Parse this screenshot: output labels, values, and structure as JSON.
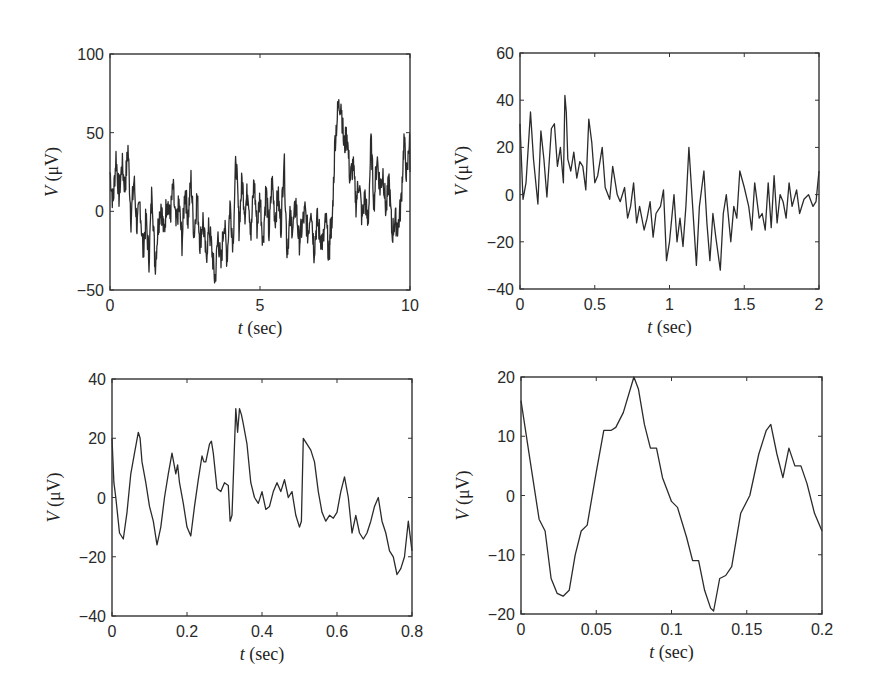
{
  "figure": {
    "width": 873,
    "height": 699,
    "line_color": "#2b2b2b",
    "frame_color": "#333333"
  },
  "chart_data": [
    {
      "type": "line",
      "panel": "top-left",
      "title": "",
      "xlabel_var": "t",
      "xlabel_unit": " (sec)",
      "ylabel_var": "V",
      "ylabel_unit": " (μV)",
      "xlim": [
        0,
        10
      ],
      "ylim": [
        -50,
        100
      ],
      "xticks": [
        0,
        5,
        10
      ],
      "yticks": [
        -50,
        0,
        50,
        100
      ],
      "xtick_labels": [
        "0",
        "5",
        "10"
      ],
      "ytick_labels": [
        "−50",
        "0",
        "50",
        "100"
      ],
      "box": {
        "left": 110,
        "top": 54,
        "right": 410,
        "bottom": 290
      },
      "grid": false,
      "x": [
        0,
        0.1,
        0.2,
        0.3,
        0.4,
        0.5,
        0.6,
        0.7,
        0.8,
        0.9,
        1.0,
        1.1,
        1.2,
        1.3,
        1.4,
        1.5,
        1.6,
        1.7,
        1.8,
        1.9,
        2.0,
        2.1,
        2.2,
        2.3,
        2.4,
        2.5,
        2.6,
        2.7,
        2.8,
        2.9,
        3.0,
        3.1,
        3.2,
        3.3,
        3.4,
        3.5,
        3.6,
        3.7,
        3.8,
        3.9,
        4.0,
        4.1,
        4.2,
        4.3,
        4.4,
        4.5,
        4.6,
        4.7,
        4.8,
        4.9,
        5.0,
        5.1,
        5.2,
        5.3,
        5.4,
        5.5,
        5.6,
        5.7,
        5.8,
        5.9,
        6.0,
        6.1,
        6.2,
        6.3,
        6.4,
        6.5,
        6.6,
        6.7,
        6.8,
        6.9,
        7.0,
        7.1,
        7.2,
        7.3,
        7.35,
        7.4,
        7.5,
        7.6,
        7.7,
        7.8,
        7.9,
        8.0,
        8.1,
        8.2,
        8.3,
        8.4,
        8.5,
        8.6,
        8.7,
        8.8,
        8.9,
        9.0,
        9.1,
        9.2,
        9.3,
        9.4,
        9.5,
        9.6,
        9.7,
        9.8,
        9.9,
        10.0
      ],
      "values": [
        25,
        5,
        35,
        10,
        30,
        15,
        40,
        -5,
        20,
        -10,
        5,
        -25,
        -5,
        -30,
        15,
        -35,
        -10,
        5,
        -15,
        10,
        -5,
        15,
        -10,
        5,
        -20,
        15,
        -5,
        20,
        -15,
        10,
        -20,
        -5,
        -30,
        -10,
        -25,
        -45,
        -15,
        -35,
        -5,
        -30,
        5,
        -20,
        35,
        -10,
        20,
        0,
        15,
        -15,
        20,
        -10,
        10,
        -20,
        15,
        -15,
        20,
        -5,
        10,
        -10,
        35,
        -25,
        -5,
        -10,
        5,
        -20,
        -10,
        0,
        -15,
        5,
        -25,
        -5,
        -15,
        -20,
        -5,
        -30,
        -10,
        -10,
        45,
        65,
        70,
        40,
        50,
        20,
        30,
        5,
        20,
        -5,
        10,
        -10,
        45,
        5,
        35,
        15,
        25,
        0,
        20,
        -15,
        -5,
        -10,
        5,
        45,
        20,
        55,
        25
      ],
      "note": "dense noisy EEG-like trace; values approximate envelope"
    },
    {
      "type": "line",
      "panel": "top-right",
      "title": "",
      "xlabel_var": "t",
      "xlabel_unit": " (sec)",
      "ylabel_var": "V",
      "ylabel_unit": " (μV)",
      "xlim": [
        0,
        2
      ],
      "ylim": [
        -40,
        60
      ],
      "xticks": [
        0,
        0.5,
        1,
        1.5,
        2
      ],
      "yticks": [
        -40,
        -20,
        0,
        20,
        40,
        60
      ],
      "xtick_labels": [
        "0",
        "0.5",
        "1",
        "1.5",
        "2"
      ],
      "ytick_labels": [
        "−40",
        "−20",
        "0",
        "20",
        "40",
        "60"
      ],
      "box": {
        "left": 520,
        "top": 53,
        "right": 819,
        "bottom": 289
      },
      "grid": false,
      "x": [
        0,
        0.02,
        0.04,
        0.07,
        0.09,
        0.12,
        0.14,
        0.16,
        0.18,
        0.21,
        0.23,
        0.25,
        0.27,
        0.29,
        0.3,
        0.31,
        0.32,
        0.34,
        0.36,
        0.38,
        0.4,
        0.42,
        0.44,
        0.46,
        0.48,
        0.5,
        0.52,
        0.55,
        0.57,
        0.6,
        0.62,
        0.65,
        0.67,
        0.7,
        0.72,
        0.74,
        0.76,
        0.78,
        0.8,
        0.83,
        0.85,
        0.87,
        0.89,
        0.91,
        0.94,
        0.96,
        0.98,
        1.0,
        1.03,
        1.05,
        1.07,
        1.09,
        1.11,
        1.13,
        1.15,
        1.18,
        1.2,
        1.23,
        1.25,
        1.27,
        1.29,
        1.31,
        1.34,
        1.36,
        1.38,
        1.41,
        1.43,
        1.45,
        1.47,
        1.5,
        1.53,
        1.55,
        1.57,
        1.6,
        1.62,
        1.64,
        1.66,
        1.68,
        1.7,
        1.72,
        1.74,
        1.76,
        1.78,
        1.8,
        1.82,
        1.85,
        1.87,
        1.9,
        1.93,
        1.96,
        1.98,
        2.0
      ],
      "values": [
        30,
        -2,
        5,
        35,
        15,
        -4,
        27,
        15,
        -1,
        28,
        30,
        12,
        20,
        5,
        42,
        35,
        15,
        10,
        18,
        7,
        14,
        12,
        2,
        32,
        22,
        5,
        8,
        20,
        3,
        -2,
        12,
        0,
        -3,
        3,
        -10,
        -5,
        5,
        -12,
        -5,
        -15,
        -10,
        -3,
        -18,
        -8,
        -5,
        2,
        -28,
        -20,
        0,
        -20,
        -10,
        -22,
        -5,
        20,
        0,
        -30,
        -5,
        10,
        -12,
        -28,
        -8,
        -18,
        -32,
        -8,
        0,
        -20,
        -5,
        -10,
        10,
        3,
        -5,
        -15,
        5,
        -10,
        -8,
        -15,
        5,
        -14,
        8,
        -12,
        0,
        -3,
        -10,
        5,
        -5,
        2,
        -8,
        -2,
        0,
        -5,
        -3,
        10
      ]
    },
    {
      "type": "line",
      "panel": "bottom-left",
      "title": "",
      "xlabel_var": "t",
      "xlabel_unit": " (sec)",
      "ylabel_var": "V",
      "ylabel_unit": " (μV)",
      "xlim": [
        0,
        0.8
      ],
      "ylim": [
        -40,
        40
      ],
      "xticks": [
        0,
        0.2,
        0.4,
        0.6,
        0.8
      ],
      "yticks": [
        -40,
        -20,
        0,
        20,
        40
      ],
      "xtick_labels": [
        "0",
        "0.2",
        "0.4",
        "0.6",
        "0.8"
      ],
      "ytick_labels": [
        "−40",
        "0",
        "20",
        "40",
        "−20"
      ],
      "ytick_labels_ordered": [
        "−40",
        "−20",
        "0",
        "20",
        "40"
      ],
      "box": {
        "left": 112,
        "top": 379,
        "right": 412,
        "bottom": 616
      },
      "grid": false,
      "x": [
        0,
        0.005,
        0.01,
        0.02,
        0.03,
        0.04,
        0.05,
        0.06,
        0.07,
        0.075,
        0.08,
        0.09,
        0.1,
        0.11,
        0.12,
        0.13,
        0.14,
        0.15,
        0.16,
        0.17,
        0.175,
        0.18,
        0.19,
        0.2,
        0.21,
        0.22,
        0.23,
        0.24,
        0.245,
        0.25,
        0.26,
        0.265,
        0.27,
        0.28,
        0.29,
        0.3,
        0.31,
        0.315,
        0.32,
        0.33,
        0.335,
        0.34,
        0.345,
        0.35,
        0.36,
        0.37,
        0.38,
        0.39,
        0.4,
        0.41,
        0.42,
        0.43,
        0.44,
        0.45,
        0.46,
        0.47,
        0.48,
        0.49,
        0.5,
        0.505,
        0.51,
        0.52,
        0.53,
        0.54,
        0.55,
        0.56,
        0.57,
        0.58,
        0.59,
        0.6,
        0.61,
        0.62,
        0.63,
        0.64,
        0.65,
        0.66,
        0.67,
        0.68,
        0.69,
        0.7,
        0.71,
        0.72,
        0.73,
        0.74,
        0.75,
        0.76,
        0.77,
        0.78,
        0.79,
        0.8
      ],
      "values": [
        20,
        5,
        0,
        -12,
        -14,
        -5,
        8,
        15,
        22,
        20,
        12,
        5,
        -3,
        -8,
        -16,
        -10,
        0,
        8,
        15,
        8,
        11,
        5,
        -2,
        -10,
        -13,
        -3,
        6,
        14,
        12,
        12,
        18,
        19,
        15,
        3,
        2,
        5,
        4,
        -8,
        -6,
        30,
        22,
        30,
        28,
        25,
        18,
        5,
        0,
        -2,
        2,
        -4,
        -3,
        2,
        5,
        2,
        6,
        0,
        2,
        -6,
        -10,
        -8,
        20,
        18,
        16,
        12,
        2,
        -5,
        -8,
        -6,
        -7,
        -5,
        2,
        7,
        0,
        -12,
        -6,
        -12,
        -14,
        -12,
        -8,
        -3,
        0,
        -8,
        -12,
        -18,
        -20,
        -26,
        -24,
        -20,
        -8,
        -18
      ]
    },
    {
      "type": "line",
      "panel": "bottom-right",
      "title": "",
      "xlabel_var": "t",
      "xlabel_unit": " (sec)",
      "ylabel_var": "V",
      "ylabel_unit": " (μV)",
      "xlim": [
        0,
        0.2
      ],
      "ylim": [
        -20,
        20
      ],
      "xticks": [
        0,
        0.05,
        0.1,
        0.15,
        0.2
      ],
      "yticks": [
        -20,
        -10,
        0,
        10,
        20
      ],
      "xtick_labels": [
        "0",
        "0.05",
        "0.1",
        "0.15",
        "0.2"
      ],
      "ytick_labels": [
        "−20",
        "−10",
        "0",
        "10",
        "20"
      ],
      "box": {
        "left": 521,
        "top": 377,
        "right": 822,
        "bottom": 614
      },
      "grid": false,
      "x": [
        0,
        0.006,
        0.012,
        0.016,
        0.02,
        0.024,
        0.028,
        0.032,
        0.036,
        0.04,
        0.044,
        0.05,
        0.055,
        0.06,
        0.063,
        0.068,
        0.075,
        0.078,
        0.082,
        0.086,
        0.09,
        0.094,
        0.1,
        0.104,
        0.11,
        0.114,
        0.118,
        0.122,
        0.126,
        0.128,
        0.132,
        0.136,
        0.14,
        0.146,
        0.152,
        0.158,
        0.163,
        0.166,
        0.17,
        0.174,
        0.178,
        0.182,
        0.186,
        0.19,
        0.195,
        0.2
      ],
      "values": [
        16,
        6,
        -4,
        -6,
        -14,
        -16.5,
        -17,
        -16,
        -10,
        -6,
        -5,
        4,
        11,
        11,
        11.5,
        14,
        20,
        18,
        12,
        8,
        8,
        3,
        -1,
        -2,
        -7,
        -11,
        -11,
        -16,
        -19,
        -19.5,
        -14,
        -13.5,
        -12,
        -3,
        0,
        7,
        11,
        12,
        7,
        3,
        8,
        5,
        5,
        2,
        -3,
        -6
      ]
    }
  ]
}
